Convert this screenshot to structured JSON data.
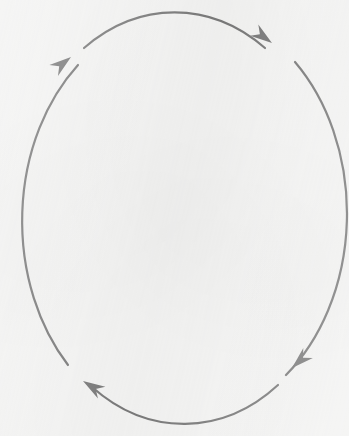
{
  "canvas": {
    "width": 349,
    "height": 436,
    "background_color": "#f4f4f3",
    "title": "Cyclical Process Diagram"
  },
  "diagram": {
    "type": "cycle",
    "shape": "ellipse",
    "direction": "clockwise",
    "stroke_color": "#7a7a7a",
    "stroke_width": 2.2,
    "arrow_fill_color": "#7a7a7a",
    "labels": [],
    "nodes": [],
    "ellipse": {
      "center_x": 178,
      "center_y": 215,
      "radius_x": 161,
      "radius_y": 206
    },
    "segments": [
      {
        "name": "top-arc",
        "path": "M 84 48 A 161 206 0 0 1 265 48",
        "from_angle_deg": 215,
        "to_angle_deg": 325,
        "arrow_at": "end"
      },
      {
        "name": "right-arc",
        "path": "M 295 62 A 161 206 0 0 1 286 375",
        "from_angle_deg": 335,
        "to_angle_deg": 58,
        "arrow_at": "end"
      },
      {
        "name": "bottom-arc",
        "path": "M 278 385 A 161 206 0 0 1 92 387",
        "from_angle_deg": 62,
        "to_angle_deg": 124,
        "arrow_at": "end"
      },
      {
        "name": "left-arc",
        "path": "M 68 365 A 161 206 0 0 1 78 65",
        "from_angle_deg": 134,
        "to_angle_deg": 222,
        "arrow_at": "end"
      }
    ],
    "arrowheads": [
      {
        "name": "top-right-arrowhead",
        "tip_x": 272,
        "tip_y": 43,
        "direction": "down-right",
        "rotation_deg": 36,
        "length": 22,
        "half_width": 7
      },
      {
        "name": "bottom-right-arrowhead",
        "tip_x": 292,
        "tip_y": 368,
        "direction": "down-left",
        "rotation_deg": 137,
        "length": 22,
        "half_width": 7
      },
      {
        "name": "bottom-left-arrowhead",
        "tip_x": 83,
        "tip_y": 381,
        "direction": "up-left",
        "rotation_deg": 212,
        "length": 22,
        "half_width": 7
      },
      {
        "name": "top-left-arrowhead",
        "tip_x": 71,
        "tip_y": 57,
        "direction": "up-right",
        "rotation_deg": 322,
        "length": 22,
        "half_width": 7
      }
    ]
  }
}
